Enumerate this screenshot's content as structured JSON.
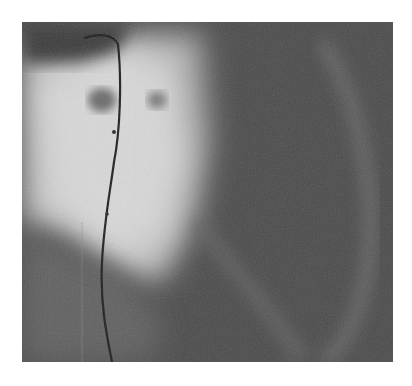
{
  "image": {
    "type": "coronary-angiogram",
    "colors": {
      "background": "#ffffff",
      "dark_tissue": "#4a4a4a",
      "bright_region": "#d8d8d8",
      "catheter": "#1e1e1e"
    }
  }
}
